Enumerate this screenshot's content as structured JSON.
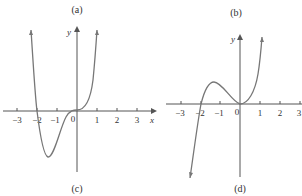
{
  "figure": {
    "panel_labels": {
      "a": "(a)",
      "b": "(b)",
      "c": "(c)",
      "d": "(d)"
    },
    "left_graph": {
      "x_axis_label": "x",
      "y_axis_label": "y",
      "origin_label": "0",
      "x_ticks": [
        "−3",
        "−2",
        "−1",
        "1",
        "2",
        "3"
      ],
      "curve": "quartic with zeros at x=-2 and x=0 (flat inflection at 0), minimum near x=-1.5"
    },
    "right_graph": {
      "x_axis_label": "x",
      "y_axis_label": "y",
      "origin_label": "0",
      "x_ticks": [
        "−3",
        "−2",
        "−1",
        "1",
        "2",
        "3"
      ],
      "curve": "cubic with zeros at x=-2 and x=0 (touching at 0), local max near x=-1.33"
    },
    "colors": {
      "axis": "#555555",
      "curve": "#777777",
      "text": "#333333"
    }
  }
}
